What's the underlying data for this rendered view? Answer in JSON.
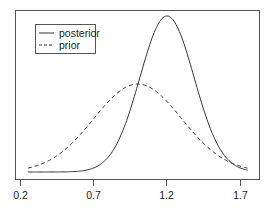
{
  "chart_data": {
    "type": "line",
    "title": "",
    "xlabel": "",
    "ylabel": "",
    "xlim": [
      0.2,
      1.78
    ],
    "x_ticks": [
      0.2,
      0.7,
      1.2,
      1.7
    ],
    "x_tick_labels": [
      "0.2",
      "0.7",
      "1.2",
      "1.7"
    ],
    "y_ticks": [],
    "grid": false,
    "legend_position": "upper-left",
    "x": [
      0.25,
      0.3,
      0.35,
      0.4,
      0.45,
      0.5,
      0.55,
      0.6,
      0.65,
      0.7,
      0.75,
      0.8,
      0.85,
      0.9,
      0.95,
      1.0,
      1.05,
      1.1,
      1.15,
      1.2,
      1.25,
      1.3,
      1.35,
      1.4,
      1.45,
      1.5,
      1.55,
      1.6,
      1.65,
      1.7,
      1.75
    ],
    "series": [
      {
        "name": "posterior",
        "style": "solid",
        "color": "#333333",
        "values": [
          0.0,
          0.0,
          0.0,
          0.0,
          0.0,
          0.0,
          0.0,
          0.001,
          0.003,
          0.007,
          0.015,
          0.031,
          0.056,
          0.096,
          0.161,
          0.556,
          0.72,
          0.864,
          0.964,
          1.0,
          0.964,
          0.864,
          0.72,
          0.556,
          0.401,
          0.268,
          0.167,
          0.096,
          0.052,
          0.026,
          0.012
        ]
      },
      {
        "name": "prior",
        "style": "dashed",
        "color": "#333333",
        "values": [
          0.025,
          0.037,
          0.053,
          0.072,
          0.096,
          0.124,
          0.156,
          0.191,
          0.228,
          0.266,
          0.304,
          0.342,
          0.394,
          0.439,
          0.476,
          0.564,
          0.557,
          0.537,
          0.505,
          0.464,
          0.416,
          0.365,
          0.313,
          0.263,
          0.216,
          0.173,
          0.135,
          0.103,
          0.076,
          0.055,
          0.039
        ]
      }
    ]
  },
  "legend": {
    "items": [
      {
        "label": "posterior",
        "style": "solid"
      },
      {
        "label": "prior",
        "style": "dashed"
      }
    ]
  },
  "axis": {
    "tick_labels": [
      "0.2",
      "0.7",
      "1.2",
      "1.7"
    ]
  }
}
